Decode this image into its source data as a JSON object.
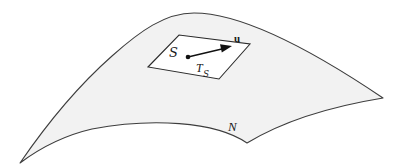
{
  "figure": {
    "kind": "geometry-diagram",
    "width": 403,
    "height": 167,
    "background_color": "#ffffff",
    "surface": {
      "label": "N",
      "fill_color": "#f2f2f2",
      "stroke_color": "#3d3d3d",
      "stroke_width": 1.1,
      "label_position": {
        "x": 228,
        "y": 121
      }
    },
    "tangent_plane": {
      "label": "T",
      "label_subscript": "S",
      "fill_color": "#ffffff",
      "stroke_color": "#2b2b2b",
      "stroke_width": 1.1,
      "label_position": {
        "x": 196,
        "y": 64
      },
      "corners": [
        {
          "x": 148,
          "y": 67
        },
        {
          "x": 179,
          "y": 35
        },
        {
          "x": 250,
          "y": 44
        },
        {
          "x": 219,
          "y": 79
        }
      ]
    },
    "point": {
      "label": "S",
      "label_position": {
        "x": 170,
        "y": 47
      },
      "dot_position": {
        "x": 188,
        "y": 57
      },
      "dot_radius": 2.2,
      "dot_color": "#111111"
    },
    "vector": {
      "label": "u",
      "label_position": {
        "x": 234,
        "y": 36
      },
      "from": {
        "x": 188,
        "y": 57
      },
      "to": {
        "x": 231,
        "y": 47
      },
      "stroke_color": "#111111",
      "stroke_width": 1.4
    }
  }
}
